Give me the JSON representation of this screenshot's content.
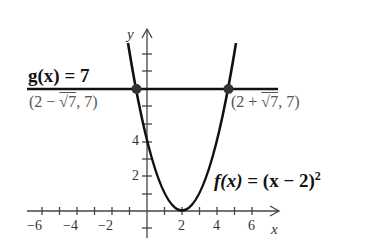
{
  "diagram": {
    "type": "function-graph",
    "functions": [
      {
        "name": "f",
        "label_parts": {
          "fx": "f(x)",
          "eq": " = (x − 2)",
          "sup": "2"
        },
        "expression": "(x-2)^2",
        "vertex": [
          2,
          0
        ]
      },
      {
        "name": "g",
        "label": "g(x) = 7",
        "expression": "7"
      }
    ],
    "intersections": [
      {
        "label_left": "(2 − ",
        "root": "√7",
        "label_right": ", 7)",
        "x": -0.6458,
        "y": 7
      },
      {
        "label_left": "(2 + ",
        "root": "√7",
        "label_right": ", 7)",
        "x": 4.6458,
        "y": 7
      }
    ],
    "axes": {
      "x_label": "x",
      "y_label": "y",
      "x_ticks": [
        "−6",
        "−4",
        "−2",
        "2",
        "4",
        "6"
      ],
      "y_ticks": [
        "2",
        "4"
      ],
      "x_range": [
        -7,
        7
      ],
      "y_range": [
        -1.5,
        9.5
      ]
    },
    "colors": {
      "curve": "#111111",
      "axis": "#333333",
      "point": "#333333"
    }
  }
}
